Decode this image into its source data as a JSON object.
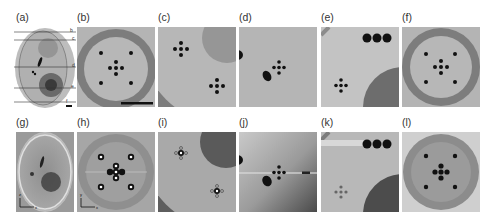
{
  "figure": {
    "top_row": [
      {
        "id": "a",
        "label": "(a)",
        "description": "Ellipsoidal phantom with slice lines",
        "slice_marks": [
          "b",
          "c",
          "d",
          "e",
          "f"
        ]
      },
      {
        "id": "b",
        "label": "(b)",
        "description": "Phantom slice with ring and point targets"
      },
      {
        "id": "c",
        "label": "(c)",
        "description": "Phantom slice with disk and cross targets"
      },
      {
        "id": "d",
        "label": "(d)",
        "description": "Phantom slice with ellipse and cross target"
      },
      {
        "id": "e",
        "label": "(e)",
        "description": "Phantom slice with three spheres and cross target"
      },
      {
        "id": "f",
        "label": "(f)",
        "description": "Phantom slice with ring and point targets"
      }
    ],
    "bottom_row": [
      {
        "id": "g",
        "label": "(g)",
        "description": "Reconstruction overview",
        "axes": {
          "vertical": "z",
          "horizontal": "x"
        }
      },
      {
        "id": "h",
        "label": "(h)",
        "description": "Reconstruction of slice b",
        "axes": {
          "vertical": "y",
          "horizontal": "x"
        }
      },
      {
        "id": "i",
        "label": "(i)",
        "description": "Reconstruction of slice c"
      },
      {
        "id": "j",
        "label": "(j)",
        "description": "Reconstruction of slice d"
      },
      {
        "id": "k",
        "label": "(k)",
        "description": "Reconstruction of slice e"
      },
      {
        "id": "l",
        "label": "(l)",
        "description": "Reconstruction of slice f"
      }
    ]
  },
  "colors": {
    "background_gray": "#b8b8b8",
    "light_gray": "#c4c4c4",
    "mid_gray": "#8c8c8c",
    "dark_gray": "#6e6e6e",
    "target_black": "#111111"
  }
}
